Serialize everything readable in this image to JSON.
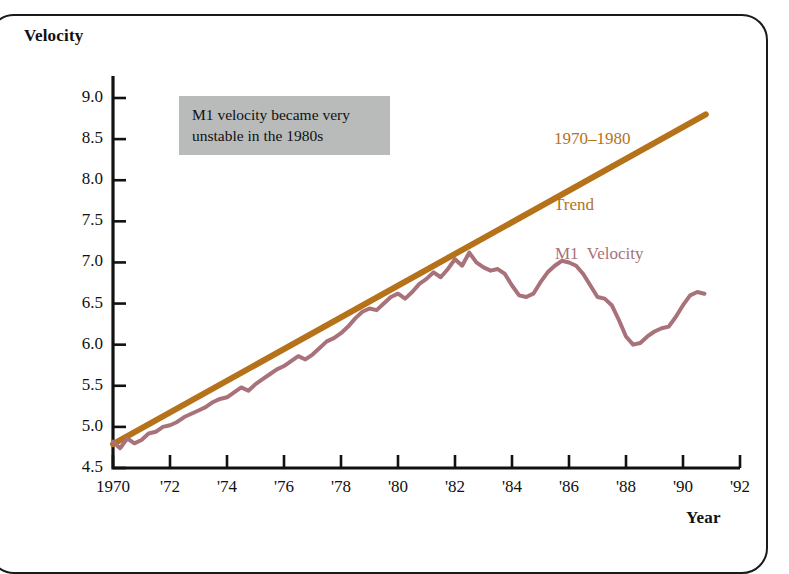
{
  "figure": {
    "velocity_axis_title": "Velocity",
    "year_axis_title": "Year",
    "annotation_line1": "M1 velocity became very",
    "annotation_line2": "unstable in the 1980s",
    "annotation_bg": "#b9bbbb",
    "trend_label_line1": "1970–1980",
    "trend_label_line2": "Trend",
    "m1_label": "M1  Velocity",
    "trend_color": "#b5721a",
    "m1_color": "#a8727a",
    "axis_color": "#111111",
    "frame_color": "#1a1a1a"
  },
  "chart_data": {
    "type": "line",
    "title": "",
    "xlabel": "Year",
    "ylabel": "Velocity",
    "xlim": [
      1970,
      1992
    ],
    "ylim": [
      4.5,
      9.0
    ],
    "grid": false,
    "legend_position": "inline-annotations",
    "ytick_labels": [
      "9.0",
      "8.5",
      "8.0",
      "7.5",
      "7.0",
      "6.5",
      "6.0",
      "5.5",
      "5.0",
      "4.5"
    ],
    "ytick_values": [
      9.0,
      8.5,
      8.0,
      7.5,
      7.0,
      6.5,
      6.0,
      5.5,
      5.0,
      4.5
    ],
    "xtick_labels": [
      "1970",
      "'72",
      "'74",
      "'76",
      "'78",
      "'80",
      "'82",
      "'84",
      "'86",
      "'88",
      "'90",
      "'92"
    ],
    "xtick_values": [
      1970,
      1972,
      1974,
      1976,
      1978,
      1980,
      1982,
      1984,
      1986,
      1988,
      1990,
      1992
    ],
    "annotations": [
      {
        "text": "M1 velocity became very unstable in the 1980s",
        "x": 1972.2,
        "y": 8.6
      },
      {
        "text": "1970–1980 Trend",
        "x": 1987.5,
        "y": 8.85
      },
      {
        "text": "M1  Velocity",
        "x": 1987.6,
        "y": 7.0
      }
    ],
    "series": [
      {
        "name": "1970–1980 Trend",
        "type": "line",
        "color": "#b5721a",
        "width": 6,
        "x": [
          1970.0,
          1990.8
        ],
        "values": [
          4.79,
          8.8
        ]
      },
      {
        "name": "M1 Velocity",
        "type": "line",
        "color": "#a8727a",
        "width": 4,
        "x": [
          1970.0,
          1970.25,
          1970.5,
          1970.75,
          1971.0,
          1971.25,
          1971.5,
          1971.75,
          1972.0,
          1972.25,
          1972.5,
          1972.75,
          1973.0,
          1973.25,
          1973.5,
          1973.75,
          1974.0,
          1974.25,
          1974.5,
          1974.75,
          1975.0,
          1975.25,
          1975.5,
          1975.75,
          1976.0,
          1976.25,
          1976.5,
          1976.75,
          1977.0,
          1977.25,
          1977.5,
          1977.75,
          1978.0,
          1978.25,
          1978.5,
          1978.75,
          1979.0,
          1979.25,
          1979.5,
          1979.75,
          1980.0,
          1980.25,
          1980.5,
          1980.75,
          1981.0,
          1981.25,
          1981.5,
          1981.75,
          1982.0,
          1982.25,
          1982.5,
          1982.75,
          1983.0,
          1983.25,
          1983.5,
          1983.75,
          1984.0,
          1984.25,
          1984.5,
          1984.75,
          1985.0,
          1985.25,
          1985.5,
          1985.75,
          1986.0,
          1986.25,
          1986.5,
          1986.75,
          1987.0,
          1987.25,
          1987.5,
          1987.75,
          1988.0,
          1988.25,
          1988.5,
          1988.75,
          1989.0,
          1989.25,
          1989.5,
          1989.75,
          1990.0,
          1990.25,
          1990.5,
          1990.75
        ],
        "values": [
          4.82,
          4.74,
          4.86,
          4.8,
          4.84,
          4.92,
          4.94,
          5.0,
          5.02,
          5.06,
          5.12,
          5.16,
          5.2,
          5.24,
          5.3,
          5.34,
          5.36,
          5.42,
          5.48,
          5.44,
          5.52,
          5.58,
          5.64,
          5.7,
          5.74,
          5.8,
          5.86,
          5.82,
          5.88,
          5.96,
          6.04,
          6.08,
          6.14,
          6.22,
          6.32,
          6.4,
          6.44,
          6.42,
          6.5,
          6.58,
          6.62,
          6.56,
          6.64,
          6.74,
          6.8,
          6.88,
          6.82,
          6.92,
          7.04,
          6.96,
          7.12,
          7.0,
          6.94,
          6.9,
          6.92,
          6.86,
          6.72,
          6.6,
          6.58,
          6.62,
          6.76,
          6.88,
          6.96,
          7.02,
          7.0,
          6.96,
          6.86,
          6.72,
          6.58,
          6.56,
          6.48,
          6.3,
          6.1,
          6.0,
          6.02,
          6.1,
          6.16,
          6.2,
          6.22,
          6.34,
          6.48,
          6.6,
          6.64,
          6.62
        ]
      }
    ]
  }
}
